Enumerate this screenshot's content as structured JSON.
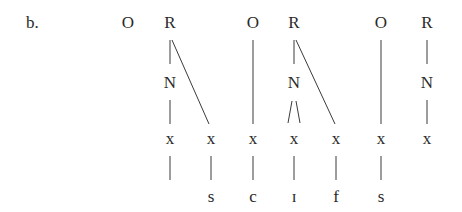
{
  "example_label": "b.",
  "nodes": {
    "o1": "O",
    "r1": "R",
    "n1": "N",
    "o2": "O",
    "r2": "R",
    "n2": "N",
    "o3": "O",
    "r3": "R",
    "n3": "N",
    "x1": "x",
    "x2": "x",
    "x3": "x",
    "x4": "x",
    "x5": "x",
    "x6": "x",
    "x7": "x"
  },
  "segments": {
    "s1": "s",
    "s2": "c",
    "s3": "ɪ",
    "s4": "f",
    "s5": "s"
  },
  "structure": {
    "syllables": [
      {
        "onset": "O",
        "rhyme": "R",
        "nucleus": "N",
        "onset_x": "x1 (empty)",
        "nucleus_x": [
          "x1"
        ],
        "coda_x": [
          "x2"
        ]
      },
      {
        "onset": "O",
        "rhyme": "R",
        "nucleus": "N",
        "onset_x": "x3",
        "nucleus_x": [
          "x4"
        ],
        "coda_x": [
          "x5"
        ]
      },
      {
        "onset": "O",
        "rhyme": "R",
        "nucleus": "N",
        "onset_x": "x6",
        "nucleus_x": [
          "x7"
        ],
        "coda_x": []
      }
    ]
  }
}
